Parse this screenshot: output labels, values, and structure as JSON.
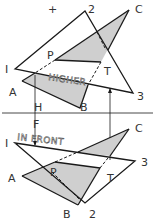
{
  "diagram": {
    "top_view": {
      "labels": {
        "plus": "+",
        "p2": "2",
        "pC": "C",
        "pP": "P",
        "p1": "I",
        "pT": "T",
        "pA": "A",
        "p3": "3",
        "pB": "B",
        "pH": "H"
      },
      "annotation": "HIGHER"
    },
    "front_view": {
      "labels": {
        "pF": "F",
        "p1": "I",
        "pC": "C",
        "p3": "3",
        "pA": "A",
        "pP": "P",
        "pT": "T",
        "pB": "B",
        "p2": "2"
      },
      "annotation": "IN FRONT"
    },
    "colors": {
      "line": "#1a1a1a",
      "shade": "#cfcfcf",
      "text": "#333333"
    }
  }
}
